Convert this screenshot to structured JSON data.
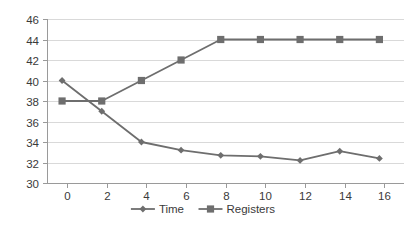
{
  "chart_data": {
    "type": "line",
    "title": "",
    "xlabel": "",
    "ylabel": "",
    "xlim": [
      0,
      16
    ],
    "ylim": [
      30,
      46
    ],
    "x": [
      0,
      2,
      4,
      6,
      8,
      10,
      12,
      14,
      16
    ],
    "xticks": [
      "0",
      "2",
      "4",
      "6",
      "8",
      "10",
      "12",
      "14",
      "16"
    ],
    "yticks": [
      "30",
      "32",
      "34",
      "36",
      "38",
      "40",
      "42",
      "44",
      "46"
    ],
    "grid": true,
    "legend_position": "bottom",
    "series": [
      {
        "name": "Time",
        "marker": "diamond",
        "color": "#6e6e6e",
        "values": [
          40,
          37,
          34,
          33.2,
          32.7,
          32.6,
          32.2,
          33.1,
          32.4
        ]
      },
      {
        "name": "Registers",
        "marker": "square",
        "color": "#6e6e6e",
        "values": [
          38,
          38,
          40,
          42,
          44,
          44,
          44,
          44,
          44
        ]
      }
    ]
  },
  "legend": {
    "items": [
      {
        "label": "Time",
        "marker": "diamond",
        "color": "#6e6e6e"
      },
      {
        "label": "Registers",
        "marker": "square",
        "color": "#6e6e6e"
      }
    ]
  },
  "colors": {
    "series": "#6e6e6e",
    "gridline": "#d9d9d9",
    "axis": "#9a9a9a",
    "text": "#3a3a3a",
    "background": "#ffffff"
  }
}
